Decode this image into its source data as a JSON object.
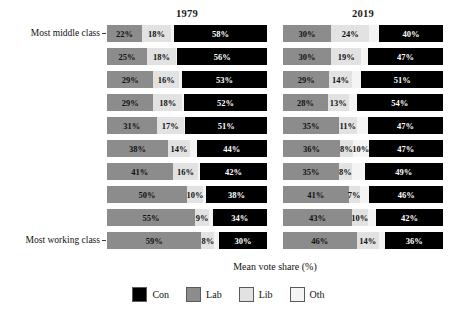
{
  "axis": {
    "x_label": "Mean vote share (%)",
    "top_label": "Most middle class",
    "bottom_label": "Most working class"
  },
  "panels": [
    {
      "title": "1979"
    },
    {
      "title": "2019"
    }
  ],
  "legend": {
    "items": [
      {
        "label": "Con",
        "color": "#000000"
      },
      {
        "label": "Lab",
        "color": "#8c8c8c"
      },
      {
        "label": "Lib",
        "color": "#e2e2e2"
      },
      {
        "label": "Oth",
        "color": "#f4f4f4"
      }
    ]
  },
  "chart_data": {
    "type": "bar",
    "orientation": "horizontal",
    "stacked": true,
    "title": "",
    "xlabel": "Mean vote share (%)",
    "ylabel": "",
    "xlim": [
      0,
      100
    ],
    "grid": false,
    "legend_position": "bottom",
    "facets": [
      "1979",
      "2019"
    ],
    "segment_order": [
      "Lab",
      "Lib",
      "Oth",
      "Con"
    ],
    "categories": [
      "Most middle class",
      "decile 2",
      "decile 3",
      "decile 4",
      "decile 5",
      "decile 6",
      "decile 7",
      "decile 8",
      "decile 9",
      "Most working class"
    ],
    "panel_1979": {
      "rows": [
        {
          "Lab": "22%",
          "Lib": "18%",
          "Oth": "2%",
          "Con": "58%",
          "lab_v": 22,
          "lib_v": 18,
          "oth_v": 2,
          "con_v": 58,
          "show_oth": false
        },
        {
          "Lab": "25%",
          "Lib": "18%",
          "Oth": "1%",
          "Con": "56%",
          "lab_v": 25,
          "lib_v": 18,
          "oth_v": 1,
          "con_v": 56,
          "show_oth": false
        },
        {
          "Lab": "29%",
          "Lib": "16%",
          "Oth": "2%",
          "Con": "53%",
          "lab_v": 29,
          "lib_v": 16,
          "oth_v": 2,
          "con_v": 53,
          "show_oth": false
        },
        {
          "Lab": "29%",
          "Lib": "18%",
          "Oth": "1%",
          "Con": "52%",
          "lab_v": 29,
          "lib_v": 18,
          "oth_v": 1,
          "con_v": 52,
          "show_oth": false
        },
        {
          "Lab": "31%",
          "Lib": "17%",
          "Oth": "1%",
          "Con": "51%",
          "lab_v": 31,
          "lib_v": 17,
          "oth_v": 1,
          "con_v": 51,
          "show_oth": false
        },
        {
          "Lab": "38%",
          "Lib": "14%",
          "Oth": "4%",
          "Con": "44%",
          "lab_v": 38,
          "lib_v": 14,
          "oth_v": 4,
          "con_v": 44,
          "show_oth": false
        },
        {
          "Lab": "41%",
          "Lib": "16%",
          "Oth": "1%",
          "Con": "42%",
          "lab_v": 41,
          "lib_v": 16,
          "oth_v": 1,
          "con_v": 42,
          "show_oth": false
        },
        {
          "Lab": "50%",
          "Lib": "10%",
          "Oth": "2%",
          "Con": "38%",
          "lab_v": 50,
          "lib_v": 10,
          "oth_v": 2,
          "con_v": 38,
          "show_oth": false
        },
        {
          "Lab": "55%",
          "Lib": "9%",
          "Oth": "2%",
          "Con": "34%",
          "lab_v": 55,
          "lib_v": 9,
          "oth_v": 2,
          "con_v": 34,
          "show_oth": false
        },
        {
          "Lab": "59%",
          "Lib": "8%",
          "Oth": "3%",
          "Con": "30%",
          "lab_v": 59,
          "lib_v": 8,
          "oth_v": 3,
          "con_v": 30,
          "show_oth": false
        }
      ]
    },
    "panel_2019": {
      "rows": [
        {
          "Lab": "30%",
          "Lib": "24%",
          "Oth": "6%",
          "Con": "40%",
          "lab_v": 30,
          "lib_v": 24,
          "oth_v": 6,
          "con_v": 40,
          "show_oth": false
        },
        {
          "Lab": "30%",
          "Lib": "19%",
          "Oth": "4%",
          "Con": "47%",
          "lab_v": 30,
          "lib_v": 19,
          "oth_v": 4,
          "con_v": 47,
          "show_oth": false
        },
        {
          "Lab": "29%",
          "Lib": "14%",
          "Oth": "6%",
          "Con": "51%",
          "lab_v": 29,
          "lib_v": 14,
          "oth_v": 6,
          "con_v": 51,
          "show_oth": false
        },
        {
          "Lab": "28%",
          "Lib": "13%",
          "Oth": "5%",
          "Con": "54%",
          "lab_v": 28,
          "lib_v": 13,
          "oth_v": 5,
          "con_v": 54,
          "show_oth": false
        },
        {
          "Lab": "35%",
          "Lib": "11%",
          "Oth": "7%",
          "Con": "47%",
          "lab_v": 35,
          "lib_v": 11,
          "oth_v": 7,
          "con_v": 47,
          "show_oth": false
        },
        {
          "Lab": "36%",
          "Lib": "8%",
          "Oth": "10%",
          "Con": "47%",
          "lab_v": 36,
          "lib_v": 8,
          "oth_v": 10,
          "con_v": 47,
          "show_oth": true
        },
        {
          "Lab": "35%",
          "Lib": "8%",
          "Oth": "8%",
          "Con": "49%",
          "lab_v": 35,
          "lib_v": 8,
          "oth_v": 8,
          "con_v": 49,
          "show_oth": false
        },
        {
          "Lab": "41%",
          "Lib": "7%",
          "Oth": "6%",
          "Con": "46%",
          "lab_v": 41,
          "lib_v": 7,
          "oth_v": 6,
          "con_v": 46,
          "show_oth": false
        },
        {
          "Lab": "43%",
          "Lib": "10%",
          "Oth": "5%",
          "Con": "42%",
          "lab_v": 43,
          "lib_v": 10,
          "oth_v": 5,
          "con_v": 42,
          "show_oth": false
        },
        {
          "Lab": "46%",
          "Lib": "14%",
          "Oth": "4%",
          "Con": "36%",
          "lab_v": 46,
          "lib_v": 14,
          "oth_v": 4,
          "con_v": 36,
          "show_oth": false
        }
      ]
    }
  }
}
